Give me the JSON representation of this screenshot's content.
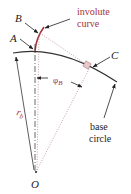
{
  "diagram": {
    "labels": {
      "point_a": "A",
      "point_b": "B",
      "point_c": "C",
      "center_o": "O",
      "involute_line1": "involute",
      "involute_line2": "curve",
      "base_line1": "base",
      "base_line2": "circle",
      "radius_symbol": "r",
      "radius_sub": "b",
      "angle_symbol": "φ",
      "angle_sub": "B"
    },
    "colors": {
      "involute": "#a8323e",
      "lines": "#333333",
      "dotted": "#b07a80",
      "square_fill": "#e9c9cc"
    }
  }
}
